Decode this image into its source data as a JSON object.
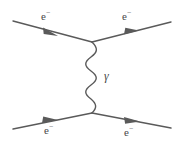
{
  "diagram": {
    "name": "feynman-diagram-moller-scattering",
    "background_color": "#ffffff",
    "stroke_color": "#5a5a5a",
    "text_color": "#4a4a4a",
    "stroke_width": 1.4
  },
  "labels": {
    "electron_in_top": "e",
    "electron_in_top_charge": "−",
    "electron_out_top": "e",
    "electron_out_top_charge": "−",
    "electron_in_bottom": "e",
    "electron_in_bottom_charge": "−",
    "electron_out_bottom": "e",
    "electron_out_bottom_charge": "−",
    "photon": "γ"
  },
  "geometry": {
    "vertex_top": {
      "x": 92,
      "y": 42
    },
    "vertex_bottom": {
      "x": 92,
      "y": 113
    },
    "fermion_lines": [
      {
        "name": "incoming-electron-top-left",
        "x1": 13,
        "y1": 21,
        "x2": 92,
        "y2": 42,
        "arrow_t": 0.47
      },
      {
        "name": "outgoing-electron-top-right",
        "x1": 92,
        "y1": 42,
        "x2": 171,
        "y2": 22,
        "arrow_t": 0.53
      },
      {
        "name": "incoming-electron-bottom-left",
        "x1": 13,
        "y1": 129,
        "x2": 92,
        "y2": 113,
        "arrow_t": 0.47
      },
      {
        "name": "outgoing-electron-bottom-right",
        "x1": 92,
        "y1": 113,
        "x2": 171,
        "y2": 128,
        "arrow_t": 0.53
      }
    ],
    "photon_wave": {
      "name": "photon-propagator",
      "center_x": 91,
      "y_start": 42,
      "y_end": 113,
      "amplitude": 5.5,
      "cycles": 5.5
    }
  }
}
